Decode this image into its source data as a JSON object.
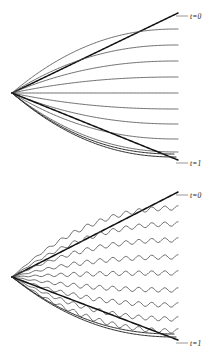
{
  "figure": {
    "background_color": "#ffffff",
    "ink_color": "#121212",
    "curve_color": "#4a4a4a",
    "panels": [
      {
        "id": "panel-smooth",
        "name": "smooth-characteristic-fan",
        "labels": {
          "top": "t=0",
          "bottom": "t=1"
        },
        "origin": {
          "x": 12,
          "y": 93
        },
        "right_edge": 178,
        "curve_count": 11
      },
      {
        "id": "panel-wavy",
        "name": "oscillatory-characteristic-fan",
        "labels": {
          "top": "t=0",
          "bottom": "t=1"
        },
        "origin": {
          "x": 12,
          "y": 97
        },
        "right_edge": 178,
        "curve_count": 11
      }
    ]
  },
  "chart_data": [
    {
      "type": "line",
      "name": "smooth-fan",
      "title": "",
      "xlabel": "",
      "ylabel": "",
      "xlim": [
        12,
        178
      ],
      "ylim": [
        10,
        170
      ],
      "grid": false,
      "legend": "none",
      "annotations": [
        {
          "text": "t=0",
          "x": 190,
          "y": 13
        },
        {
          "text": "t=1",
          "x": 190,
          "y": 160
        }
      ],
      "description": "Fan of characteristic curves emanating from a single left-hand vertex, fanning rightward; outermost upper and lower rays are straight and heavy, interior rays bend and flatten into horizontal lines.",
      "origin": {
        "x": 12,
        "y": 93
      },
      "series": [
        {
          "name": "envelope-upper",
          "end_y": 13,
          "straight": true,
          "weight": "heavy"
        },
        {
          "name": "ray-1",
          "end_y": 29,
          "straight": false,
          "weight": "light"
        },
        {
          "name": "ray-2",
          "end_y": 45,
          "straight": false,
          "weight": "light"
        },
        {
          "name": "ray-3",
          "end_y": 61,
          "straight": false,
          "weight": "light"
        },
        {
          "name": "ray-4",
          "end_y": 77,
          "straight": false,
          "weight": "light"
        },
        {
          "name": "ray-5",
          "end_y": 93,
          "straight": false,
          "weight": "light"
        },
        {
          "name": "ray-6",
          "end_y": 109,
          "straight": false,
          "weight": "light"
        },
        {
          "name": "ray-7",
          "end_y": 124,
          "straight": false,
          "weight": "light"
        },
        {
          "name": "ray-8",
          "end_y": 139,
          "straight": false,
          "weight": "light"
        },
        {
          "name": "ray-9",
          "end_y": 152,
          "straight": false,
          "weight": "light"
        },
        {
          "name": "envelope-lower",
          "end_y": 160,
          "straight": true,
          "weight": "heavy"
        }
      ]
    },
    {
      "type": "line",
      "name": "oscillatory-fan",
      "title": "",
      "xlabel": "",
      "ylabel": "",
      "xlim": [
        12,
        178
      ],
      "ylim": [
        190,
        350
      ],
      "grid": false,
      "legend": "none",
      "annotations": [
        {
          "text": "t=0",
          "x": 190,
          "y": 192
        },
        {
          "text": "t=1",
          "x": 190,
          "y": 340
        }
      ],
      "description": "Same characteristic fan, but each interior ray carries small sinusoidal oscillations of growing amplitude along its length; outer envelopes remain straight and heavy.",
      "origin": {
        "x": 12,
        "y": 277
      },
      "oscillation": {
        "wavelength": 13,
        "max_amplitude": 2.2
      },
      "series": [
        {
          "name": "envelope-upper",
          "end_y": 192,
          "straight": true,
          "weight": "heavy",
          "wavy": false
        },
        {
          "name": "ray-1",
          "end_y": 208,
          "straight": false,
          "weight": "light",
          "wavy": true
        },
        {
          "name": "ray-2",
          "end_y": 224,
          "straight": false,
          "weight": "light",
          "wavy": true
        },
        {
          "name": "ray-3",
          "end_y": 240,
          "straight": false,
          "weight": "light",
          "wavy": true
        },
        {
          "name": "ray-4",
          "end_y": 257,
          "straight": false,
          "weight": "light",
          "wavy": true
        },
        {
          "name": "ray-5",
          "end_y": 273,
          "straight": false,
          "weight": "light",
          "wavy": true
        },
        {
          "name": "ray-6",
          "end_y": 290,
          "straight": false,
          "weight": "light",
          "wavy": true
        },
        {
          "name": "ray-7",
          "end_y": 305,
          "straight": false,
          "weight": "light",
          "wavy": true
        },
        {
          "name": "ray-8",
          "end_y": 319,
          "straight": false,
          "weight": "light",
          "wavy": true
        },
        {
          "name": "ray-9",
          "end_y": 331,
          "straight": false,
          "weight": "light",
          "wavy": true
        },
        {
          "name": "envelope-lower",
          "end_y": 340,
          "straight": true,
          "weight": "heavy",
          "wavy": false
        }
      ]
    }
  ]
}
